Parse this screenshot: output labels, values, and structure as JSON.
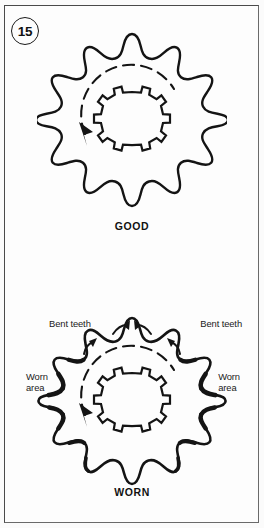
{
  "figure": {
    "number": "15",
    "badge_name": "figure-number-15"
  },
  "panels": [
    {
      "id": "good",
      "caption": "GOOD",
      "sprocket": {
        "teeth_count": 15,
        "condition": "good",
        "rotation_label": "counter-clockwise",
        "hub_type": "splined-bore"
      },
      "callouts": []
    },
    {
      "id": "worn",
      "caption": "WORN",
      "sprocket": {
        "teeth_count": 15,
        "condition": "worn",
        "rotation_label": "counter-clockwise",
        "hub_type": "splined-bore"
      },
      "callouts": [
        {
          "id": "bent-teeth-left",
          "text": "Bent teeth"
        },
        {
          "id": "bent-teeth-right",
          "text": "Bent teeth"
        },
        {
          "id": "worn-area-left",
          "text": "Worn\narea"
        },
        {
          "id": "worn-area-right",
          "text": "Worn\narea"
        }
      ]
    }
  ],
  "colors": {
    "ink": "#111111",
    "frame": "#4a4a4a",
    "page": "#fdfdfd"
  }
}
